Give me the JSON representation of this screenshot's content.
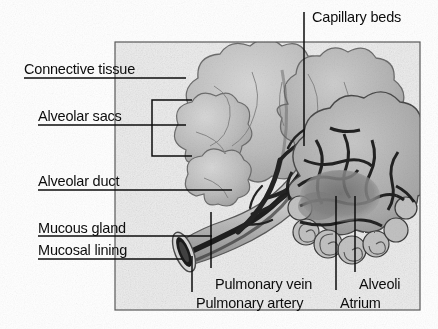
{
  "figure": {
    "type": "scanned-anatomical-diagram",
    "frame": {
      "x": 115,
      "y": 42,
      "width": 305,
      "height": 268
    }
  },
  "colors": {
    "ink": "#0d0d0d",
    "paper": "#ffffff",
    "panel_fill": "#eeeeee",
    "tissue_light": "#cfcfcf",
    "tissue_mid": "#b4b4b4",
    "tissue_dark": "#8f8f8f",
    "vessel_dark": "#2a2a2a",
    "frame_line": "#555555"
  },
  "labels": {
    "capillary_beds": "Capillary beds",
    "connective_tissue": "Connective tissue",
    "alveolar_sacs": "Alveolar sacs",
    "alveolar_duct": "Alveolar duct",
    "mucous_gland": "Mucous gland",
    "mucosal_lining": "Mucosal lining",
    "pulmonary_vein": "Pulmonary vein",
    "pulmonary_artery": "Pulmonary artery",
    "alveoli": "Alveoli",
    "atrium": "Atrium"
  },
  "label_positions": {
    "capillary_beds": {
      "x": 312,
      "y": 10
    },
    "connective_tissue": {
      "x": 24,
      "y": 62
    },
    "alveolar_sacs": {
      "x": 38,
      "y": 109
    },
    "alveolar_duct": {
      "x": 38,
      "y": 174
    },
    "mucous_gland": {
      "x": 38,
      "y": 221
    },
    "mucosal_lining": {
      "x": 38,
      "y": 243
    },
    "pulmonary_vein": {
      "x": 215,
      "y": 277
    },
    "pulmonary_artery": {
      "x": 196,
      "y": 296
    },
    "alveoli": {
      "x": 359,
      "y": 277
    },
    "atrium": {
      "x": 340,
      "y": 296
    }
  },
  "leader_lines": [
    {
      "name": "capillary-beds-leader",
      "points": "304,12 304,146"
    },
    {
      "name": "connective-tissue-leader",
      "points": "24,78 186,78"
    },
    {
      "name": "alveolar-sacs-leader",
      "points": "38,125 186,125"
    },
    {
      "name": "alveolar-sacs-bracket",
      "points": "152,100 192,100 152,100 152,156 192,156"
    },
    {
      "name": "alveolar-duct-leader",
      "points": "38,190 232,190"
    },
    {
      "name": "mucous-gland-leader",
      "points": "38,236 212,236"
    },
    {
      "name": "mucosal-lining-leader",
      "points": "38,259 182,259"
    },
    {
      "name": "pulmonary-vein-leader",
      "points": "211,268 211,212"
    },
    {
      "name": "pulmonary-artery-leader",
      "points": "192,290 192,256"
    },
    {
      "name": "alveoli-leader",
      "points": "355,270 355,196"
    },
    {
      "name": "atrium-leader",
      "points": "336,290 336,196"
    }
  ],
  "icons": {
    "alveolar_sac_cluster": "lobed-cloud-shape",
    "capillary_mesh": "web-network-shape",
    "bronchiole_tube": "cut-tube-ellipse",
    "vessel_tree": "branching-tree-shape"
  }
}
